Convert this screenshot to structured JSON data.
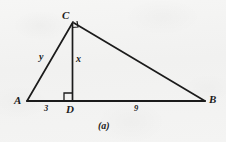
{
  "figure": {
    "caption": "(a)",
    "background_color": "#f2f2f1",
    "ink_color": "#1b1b1b",
    "description_type": "right-triangle-with-altitude"
  },
  "vertices": {
    "a": {
      "label": "A",
      "x": 27,
      "y": 101
    },
    "b": {
      "label": "B",
      "x": 205,
      "y": 101
    },
    "c": {
      "label": "C",
      "x": 73,
      "y": 22
    },
    "d": {
      "label": "D",
      "x": 72,
      "y": 101
    }
  },
  "sides": {
    "altitude": {
      "label": "x",
      "from": "C",
      "to": "D"
    },
    "leg_ac": {
      "label": "y",
      "from": "A",
      "to": "C"
    }
  },
  "measures": {
    "ad": {
      "label": "3",
      "value": 3,
      "from": "A",
      "to": "D"
    },
    "db": {
      "label": "9",
      "value": 9,
      "from": "D",
      "to": "B"
    }
  },
  "right_angles": [
    {
      "at": "D",
      "name": "right-angle-mark-d"
    },
    {
      "at": "C",
      "name": "right-angle-mark-c"
    }
  ]
}
